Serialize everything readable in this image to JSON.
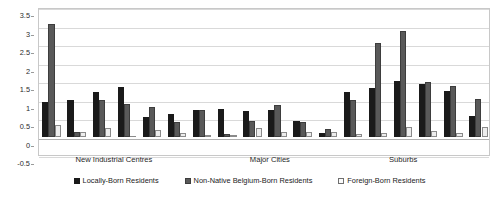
{
  "chart_data": {
    "type": "bar",
    "title": "",
    "subtitle": "",
    "xlabel": "",
    "ylabel": "",
    "ylim": [
      -0.5,
      3.5
    ],
    "ytick_labels": [
      "3.5",
      "3",
      "2.5",
      "2",
      "1.5",
      "1",
      "0.5",
      "0",
      "-0.5"
    ],
    "ytick_values": [
      3.5,
      3,
      2.5,
      2,
      1.5,
      1,
      0.5,
      0,
      -0.5
    ],
    "grid": true,
    "legend_position": "bottom",
    "categories": [
      "1",
      "2",
      "3",
      "4",
      "5",
      "6",
      "7",
      "8",
      "9",
      "10",
      "11",
      "12",
      "13",
      "14",
      "15",
      "16",
      "17",
      "18"
    ],
    "series": [
      {
        "name": "Locally-Born Residents",
        "color": "#1a1a1a",
        "values": [
          0.93,
          1.0,
          1.21,
          1.33,
          0.52,
          0.62,
          0.72,
          0.75,
          0.7,
          0.72,
          0.42,
          0.09,
          1.2,
          1.32,
          1.49,
          1.43,
          1.24,
          0.56
        ]
      },
      {
        "name": "Non-Native Belgium-Born Residents",
        "color": "#595959",
        "values": [
          3.03,
          0.12,
          0.99,
          0.89,
          0.79,
          0.39,
          0.72,
          0.07,
          0.43,
          0.84,
          0.38,
          0.19,
          0.98,
          2.53,
          2.86,
          1.47,
          1.37,
          1.01
        ]
      },
      {
        "name": "Foreign-Born Residents",
        "color": "#ededed",
        "values": [
          0.3,
          0.11,
          0.22,
          -0.02,
          0.17,
          0.1,
          0.04,
          0.01,
          0.22,
          0.13,
          0.13,
          0.11,
          0.06,
          0.09,
          0.26,
          0.15,
          0.1,
          0.27
        ]
      }
    ],
    "group_labels": [
      {
        "label": "New Industrial Centres",
        "center_fraction": 0.168
      },
      {
        "label": "Major Cities",
        "center_fraction": 0.513
      },
      {
        "label": "Suburbs",
        "center_fraction": 0.808
      }
    ]
  },
  "legend": {
    "items": [
      {
        "label": "Locally-Born Residents"
      },
      {
        "label": "Non-Native Belgium-Born Residents"
      },
      {
        "label": "Foreign-Born Residents"
      }
    ]
  }
}
